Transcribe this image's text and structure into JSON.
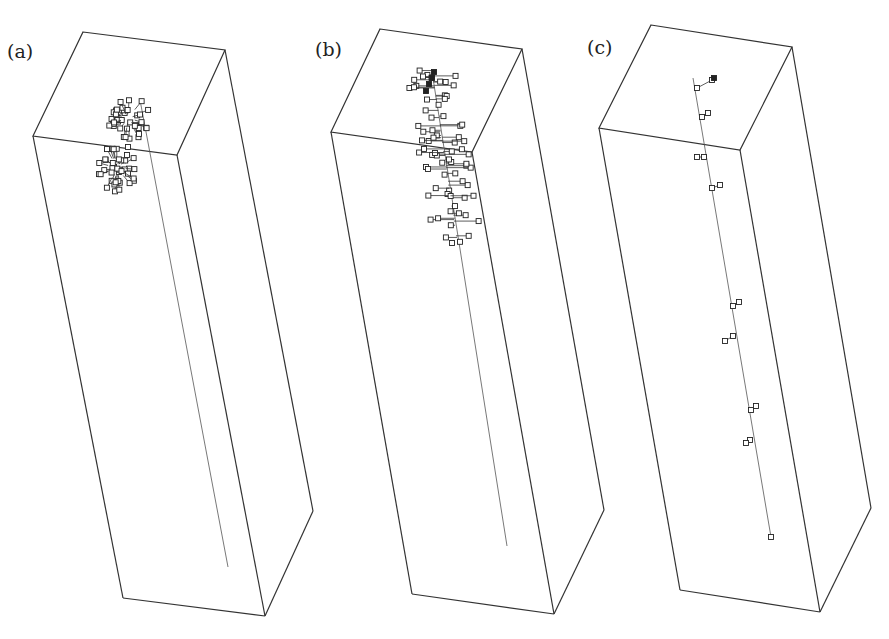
{
  "figure": {
    "panels": [
      {
        "id": "a",
        "label": "(a)",
        "description": "Compact branched cluster of square nodes near the top of a rectangular box, with a thin line extending down to the bottom",
        "box": {
          "top": [
            [
              83,
              32
            ],
            [
              225,
              50
            ],
            [
              177,
              155
            ],
            [
              33,
              136
            ]
          ],
          "bottom_left": [
            123,
            598
          ],
          "bottom_front": [
            265,
            616
          ],
          "bottom_right": [
            313,
            511
          ]
        },
        "chain": {
          "start": [
            140,
            100
          ],
          "end": [
            228,
            567
          ]
        }
      },
      {
        "id": "b",
        "label": "(b)",
        "description": "Elongated branched chain of square nodes extending from the top face down the box, with a thin line continuing to the bottom",
        "box": {
          "top": [
            [
              380,
              29
            ],
            [
              522,
              49
            ],
            [
              472,
              152
            ],
            [
              331,
              132
            ]
          ],
          "bottom_left": [
            412,
            594
          ],
          "bottom_front": [
            554,
            614
          ],
          "bottom_right": [
            604,
            510
          ]
        },
        "chain": {
          "start": [
            432,
            72
          ],
          "end": [
            507,
            546
          ]
        }
      },
      {
        "id": "c",
        "label": "(c)",
        "description": "Nearly straight chain with sparse short side branches of square nodes spanning the length of the box",
        "box": {
          "top": [
            [
              651,
              25
            ],
            [
              792,
              47
            ],
            [
              740,
              150
            ],
            [
              599,
              128
            ]
          ],
          "bottom_left": [
            680,
            590
          ],
          "bottom_front": [
            820,
            612
          ],
          "bottom_right": [
            871,
            508
          ]
        },
        "chain": {
          "start": [
            693,
            78
          ],
          "end": [
            771,
            537
          ]
        }
      }
    ]
  }
}
